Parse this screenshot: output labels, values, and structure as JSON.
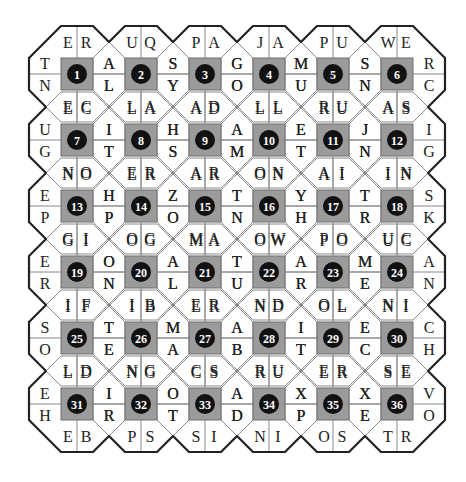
{
  "puzzle": {
    "grid": {
      "rows": 6,
      "cols": 6
    },
    "colors": {
      "square": "#9b9b9b",
      "square_border": "#6e6e6e",
      "circle": "#111111",
      "number": "#ffffff",
      "outline": "#222222",
      "divider": "#8a8a8a",
      "letter": "#222222"
    },
    "cells": [
      {
        "n": "1",
        "top": [
          "E",
          "R"
        ],
        "right": [
          "A",
          "L"
        ],
        "bottom": [
          "E",
          "C"
        ],
        "left": [
          "T",
          "N"
        ]
      },
      {
        "n": "2",
        "top": [
          "U",
          "Q"
        ],
        "right": [
          "S",
          "Y"
        ],
        "bottom": [
          "L",
          "A"
        ],
        "left": [
          "A",
          "L"
        ]
      },
      {
        "n": "3",
        "top": [
          "P",
          "A"
        ],
        "right": [
          "G",
          "O"
        ],
        "bottom": [
          "A",
          "D"
        ],
        "left": [
          "S",
          "Y"
        ]
      },
      {
        "n": "4",
        "top": [
          "J",
          "A"
        ],
        "right": [
          "M",
          "U"
        ],
        "bottom": [
          "L",
          "L"
        ],
        "left": [
          "G",
          "O"
        ]
      },
      {
        "n": "5",
        "top": [
          "P",
          "U"
        ],
        "right": [
          "S",
          "N"
        ],
        "bottom": [
          "R",
          "U"
        ],
        "left": [
          "M",
          "U"
        ]
      },
      {
        "n": "6",
        "top": [
          "W",
          "E"
        ],
        "right": [
          "R",
          "C"
        ],
        "bottom": [
          "A",
          "S"
        ],
        "left": [
          "S",
          "N"
        ]
      },
      {
        "n": "7",
        "top": [
          "E",
          "C"
        ],
        "right": [
          "I",
          "T"
        ],
        "bottom": [
          "N",
          "O"
        ],
        "left": [
          "U",
          "G"
        ]
      },
      {
        "n": "8",
        "top": [
          "L",
          "A"
        ],
        "right": [
          "H",
          "S"
        ],
        "bottom": [
          "E",
          "R"
        ],
        "left": [
          "I",
          "T"
        ]
      },
      {
        "n": "9",
        "top": [
          "A",
          "D"
        ],
        "right": [
          "A",
          "M"
        ],
        "bottom": [
          "A",
          "R"
        ],
        "left": [
          "H",
          "S"
        ]
      },
      {
        "n": "10",
        "top": [
          "L",
          "L"
        ],
        "right": [
          "E",
          "T"
        ],
        "bottom": [
          "O",
          "N"
        ],
        "left": [
          "A",
          "M"
        ]
      },
      {
        "n": "11",
        "top": [
          "R",
          "U"
        ],
        "right": [
          "J",
          "N"
        ],
        "bottom": [
          "A",
          "I"
        ],
        "left": [
          "E",
          "T"
        ]
      },
      {
        "n": "12",
        "top": [
          "A",
          "S"
        ],
        "right": [
          "I",
          "G"
        ],
        "bottom": [
          "I",
          "N"
        ],
        "left": [
          "J",
          "N"
        ]
      },
      {
        "n": "13",
        "top": [
          "N",
          "O"
        ],
        "right": [
          "H",
          "P"
        ],
        "bottom": [
          "G",
          "I"
        ],
        "left": [
          "E",
          "P"
        ]
      },
      {
        "n": "14",
        "top": [
          "E",
          "R"
        ],
        "right": [
          "Z",
          "O"
        ],
        "bottom": [
          "O",
          "G"
        ],
        "left": [
          "H",
          "P"
        ]
      },
      {
        "n": "15",
        "top": [
          "A",
          "R"
        ],
        "right": [
          "T",
          "N"
        ],
        "bottom": [
          "M",
          "A"
        ],
        "left": [
          "Z",
          "O"
        ]
      },
      {
        "n": "16",
        "top": [
          "O",
          "N"
        ],
        "right": [
          "Y",
          "H"
        ],
        "bottom": [
          "O",
          "W"
        ],
        "left": [
          "T",
          "N"
        ]
      },
      {
        "n": "17",
        "top": [
          "A",
          "I"
        ],
        "right": [
          "T",
          "R"
        ],
        "bottom": [
          "P",
          "O"
        ],
        "left": [
          "Y",
          "H"
        ]
      },
      {
        "n": "18",
        "top": [
          "I",
          "N"
        ],
        "right": [
          "S",
          "K"
        ],
        "bottom": [
          "U",
          "C"
        ],
        "left": [
          "T",
          "R"
        ]
      },
      {
        "n": "19",
        "top": [
          "G",
          "I"
        ],
        "right": [
          "O",
          "N"
        ],
        "bottom": [
          "I",
          "F"
        ],
        "left": [
          "E",
          "R"
        ]
      },
      {
        "n": "20",
        "top": [
          "O",
          "G"
        ],
        "right": [
          "A",
          "L"
        ],
        "bottom": [
          "I",
          "B"
        ],
        "left": [
          "O",
          "N"
        ]
      },
      {
        "n": "21",
        "top": [
          "M",
          "A"
        ],
        "right": [
          "T",
          "U"
        ],
        "bottom": [
          "E",
          "R"
        ],
        "left": [
          "A",
          "L"
        ]
      },
      {
        "n": "22",
        "top": [
          "O",
          "W"
        ],
        "right": [
          "A",
          "R"
        ],
        "bottom": [
          "N",
          "D"
        ],
        "left": [
          "T",
          "U"
        ]
      },
      {
        "n": "23",
        "top": [
          "P",
          "O"
        ],
        "right": [
          "M",
          "E"
        ],
        "bottom": [
          "O",
          "L"
        ],
        "left": [
          "A",
          "R"
        ]
      },
      {
        "n": "24",
        "top": [
          "U",
          "C"
        ],
        "right": [
          "A",
          "N"
        ],
        "bottom": [
          "N",
          "I"
        ],
        "left": [
          "M",
          "E"
        ]
      },
      {
        "n": "25",
        "top": [
          "I",
          "F"
        ],
        "right": [
          "T",
          "E"
        ],
        "bottom": [
          "L",
          "D"
        ],
        "left": [
          "S",
          "O"
        ]
      },
      {
        "n": "26",
        "top": [
          "I",
          "B"
        ],
        "right": [
          "M",
          "A"
        ],
        "bottom": [
          "N",
          "G"
        ],
        "left": [
          "T",
          "E"
        ]
      },
      {
        "n": "27",
        "top": [
          "E",
          "R"
        ],
        "right": [
          "A",
          "B"
        ],
        "bottom": [
          "C",
          "S"
        ],
        "left": [
          "M",
          "A"
        ]
      },
      {
        "n": "28",
        "top": [
          "N",
          "D"
        ],
        "right": [
          "I",
          "T"
        ],
        "bottom": [
          "R",
          "U"
        ],
        "left": [
          "A",
          "B"
        ]
      },
      {
        "n": "29",
        "top": [
          "O",
          "L"
        ],
        "right": [
          "E",
          "C"
        ],
        "bottom": [
          "E",
          "R"
        ],
        "left": [
          "I",
          "T"
        ]
      },
      {
        "n": "30",
        "top": [
          "N",
          "I"
        ],
        "right": [
          "C",
          "H"
        ],
        "bottom": [
          "S",
          "E"
        ],
        "left": [
          "E",
          "C"
        ]
      },
      {
        "n": "31",
        "top": [
          "L",
          "D"
        ],
        "right": [
          "I",
          "R"
        ],
        "bottom": [
          "E",
          "B"
        ],
        "left": [
          "E",
          "H"
        ]
      },
      {
        "n": "32",
        "top": [
          "N",
          "G"
        ],
        "right": [
          "O",
          "T"
        ],
        "bottom": [
          "P",
          "S"
        ],
        "left": [
          "I",
          "R"
        ]
      },
      {
        "n": "33",
        "top": [
          "C",
          "S"
        ],
        "right": [
          "A",
          "D"
        ],
        "bottom": [
          "S",
          "I"
        ],
        "left": [
          "O",
          "T"
        ]
      },
      {
        "n": "34",
        "top": [
          "R",
          "U"
        ],
        "right": [
          "X",
          "P"
        ],
        "bottom": [
          "N",
          "I"
        ],
        "left": [
          "A",
          "D"
        ]
      },
      {
        "n": "35",
        "top": [
          "E",
          "R"
        ],
        "right": [
          "X",
          "E"
        ],
        "bottom": [
          "O",
          "S"
        ],
        "left": [
          "X",
          "P"
        ]
      },
      {
        "n": "36",
        "top": [
          "S",
          "E"
        ],
        "right": [
          "V",
          "O"
        ],
        "bottom": [
          "T",
          "R"
        ],
        "left": [
          "X",
          "E"
        ]
      }
    ]
  }
}
